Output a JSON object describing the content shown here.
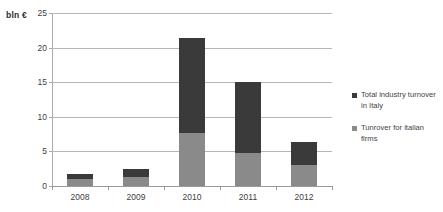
{
  "chart_data": {
    "type": "bar",
    "stacked": true,
    "title": "",
    "subtitle": "",
    "xlabel": "",
    "ylabel": "bln €",
    "unit_label": "bln €",
    "categories": [
      "2008",
      "2009",
      "2010",
      "2011",
      "2012"
    ],
    "ylim": [
      0,
      25
    ],
    "yticks": [
      0,
      5,
      10,
      15,
      20,
      25
    ],
    "ytick_labels": [
      "0",
      "5",
      "10",
      "15",
      "20",
      "25"
    ],
    "grid": true,
    "legend_position": "right",
    "series": [
      {
        "name": "Tunrover for italian firms",
        "color": "#8a8a8a",
        "values": [
          1.0,
          1.3,
          7.7,
          4.7,
          3.0
        ]
      },
      {
        "name": "Total industry turnover in Italy",
        "color": "#3a3a3a",
        "values": [
          1.8,
          2.4,
          21.4,
          15.0,
          6.4
        ]
      }
    ],
    "legend_entries": [
      {
        "label": "Total industry turnover in Italy",
        "color": "#3a3a3a"
      },
      {
        "label": "Tunrover for italian firms",
        "color": "#8a8a8a"
      }
    ]
  },
  "axis": {
    "unit_label": "bln €",
    "ytick_0": "0",
    "ytick_1": "5",
    "ytick_2": "10",
    "ytick_3": "15",
    "ytick_4": "20",
    "ytick_5": "25"
  },
  "xlabels": {
    "c0": "2008",
    "c1": "2009",
    "c2": "2010",
    "c3": "2011",
    "c4": "2012"
  },
  "legend": {
    "item0": "Total industry turnover in Italy",
    "item1": "Tunrover for italian firms"
  },
  "colors": {
    "dark": "#3a3a3a",
    "light": "#8a8a8a",
    "grid": "#b6b6b6",
    "axis": "#9a9a9a",
    "background": "#ffffff"
  }
}
